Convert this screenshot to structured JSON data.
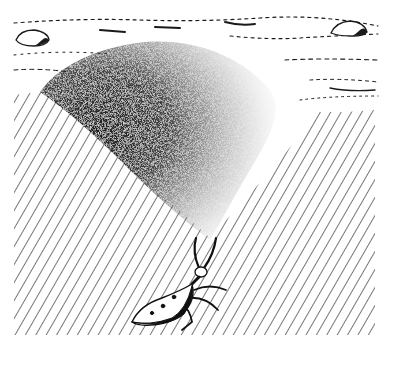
{
  "illustration": {
    "subject": "antlion larva flicking sand up a pit slope",
    "style": "black-and-white pen-and-ink with stipple and diagonal hatching",
    "colors": {
      "background": "#ffffff",
      "ink": "#1a1a1a",
      "stipple": "#222222"
    },
    "elements": {
      "ground_surface": "dotted/dashed sand surface lines across top",
      "pebbles": [
        "left pebble",
        "right pebble"
      ],
      "slope": "diagonal hatched pit wall",
      "sand_spray": "stippled fan of thrown sand, dense at left fading to right",
      "insect": "antlion larva with head tilted up, jaws open, six legs"
    }
  }
}
